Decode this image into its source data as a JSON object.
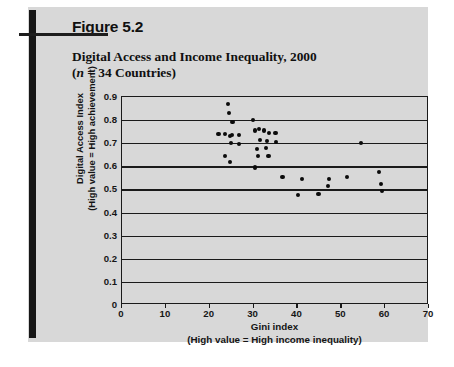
{
  "figure": {
    "number": "Figure 5.2",
    "title_line1": "Digital Access and Income Inequality, 2000",
    "title_line2_pre": "(",
    "title_line2_n": "n",
    "title_line2_post": " = 34 Countries)",
    "card_background": "#d8d8d8",
    "rule_color": "#161616"
  },
  "chart_data": {
    "type": "scatter",
    "title": "Digital Access and Income Inequality, 2000 (n = 34 Countries)",
    "xlabel": "Gini index",
    "xlabel_sub": "(High value = High income inequality)",
    "ylabel": "Digital Access Index",
    "ylabel_sub": "(High value = High achievement)",
    "xlim": [
      0,
      70
    ],
    "ylim": [
      0,
      0.9
    ],
    "xticks": [
      0,
      10,
      20,
      30,
      40,
      50,
      60,
      70
    ],
    "xtick_labels": [
      "0",
      "10",
      "20",
      "30",
      "40",
      "50",
      "60",
      "70"
    ],
    "yticks": [
      0,
      0.1,
      0.2,
      0.3,
      0.4,
      0.5,
      0.6,
      0.7,
      0.8,
      0.9
    ],
    "ytick_labels": [
      "0",
      "0.1",
      "0.2",
      "0.3",
      "0.4",
      "0.5",
      "0.6",
      "0.7",
      "0.8",
      "0.9"
    ],
    "grid": "horizontal",
    "legend": "none",
    "marker_color": "#0b0b0b",
    "n": 34,
    "points": [
      {
        "x": 24.2,
        "y": 0.87
      },
      {
        "x": 24.4,
        "y": 0.83
      },
      {
        "x": 25.2,
        "y": 0.79
      },
      {
        "x": 22.0,
        "y": 0.74
      },
      {
        "x": 23.4,
        "y": 0.74
      },
      {
        "x": 24.6,
        "y": 0.73
      },
      {
        "x": 25.1,
        "y": 0.735
      },
      {
        "x": 26.7,
        "y": 0.735
      },
      {
        "x": 24.9,
        "y": 0.7
      },
      {
        "x": 26.6,
        "y": 0.695
      },
      {
        "x": 23.5,
        "y": 0.645
      },
      {
        "x": 24.6,
        "y": 0.62
      },
      {
        "x": 29.8,
        "y": 0.8
      },
      {
        "x": 30.4,
        "y": 0.755
      },
      {
        "x": 31.3,
        "y": 0.76
      },
      {
        "x": 32.4,
        "y": 0.755
      },
      {
        "x": 33.5,
        "y": 0.745
      },
      {
        "x": 35.0,
        "y": 0.745
      },
      {
        "x": 31.5,
        "y": 0.715
      },
      {
        "x": 33.0,
        "y": 0.71
      },
      {
        "x": 35.2,
        "y": 0.705
      },
      {
        "x": 30.8,
        "y": 0.675
      },
      {
        "x": 32.8,
        "y": 0.68
      },
      {
        "x": 31.0,
        "y": 0.645
      },
      {
        "x": 33.4,
        "y": 0.645
      },
      {
        "x": 30.3,
        "y": 0.595
      },
      {
        "x": 36.6,
        "y": 0.555
      },
      {
        "x": 41.0,
        "y": 0.545
      },
      {
        "x": 40.2,
        "y": 0.475
      },
      {
        "x": 44.8,
        "y": 0.48
      },
      {
        "x": 47.3,
        "y": 0.545
      },
      {
        "x": 47.0,
        "y": 0.515
      },
      {
        "x": 51.3,
        "y": 0.555
      },
      {
        "x": 54.5,
        "y": 0.7
      },
      {
        "x": 58.6,
        "y": 0.575
      },
      {
        "x": 59.0,
        "y": 0.525
      },
      {
        "x": 59.3,
        "y": 0.495
      }
    ]
  }
}
